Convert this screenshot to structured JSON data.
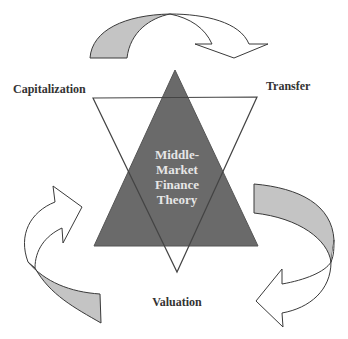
{
  "diagram": {
    "center": {
      "lines": [
        "Middle-",
        "Market",
        "Finance",
        "Theory"
      ]
    },
    "nodes": {
      "capitalization": "Capitalization",
      "transfer": "Transfer",
      "valuation": "Valuation"
    },
    "arrows": [
      {
        "from": "Capitalization",
        "to": "Transfer",
        "position": "top"
      },
      {
        "from": "Transfer",
        "to": "Valuation",
        "position": "right"
      },
      {
        "from": "Valuation",
        "to": "Capitalization",
        "position": "left"
      }
    ],
    "colors": {
      "upright_triangle_fill": "#6a6a6a",
      "inverted_triangle_stroke": "#444444",
      "arrow_band_fill": "#c4c4c4",
      "arrow_head_fill": "#ffffff",
      "outline": "#3a3a3a",
      "center_text": "#e6e6e6",
      "label_text": "#333333"
    }
  }
}
